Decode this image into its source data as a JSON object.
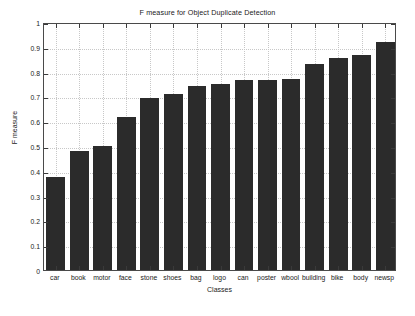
{
  "chart_data": {
    "type": "bar",
    "title": "F measure for Object Duplicate Detection",
    "xlabel": "Classes",
    "ylabel": "F measure",
    "categories": [
      "car",
      "book",
      "motor",
      "face",
      "stone",
      "shoes",
      "bag",
      "logo",
      "can",
      "poster",
      "wbool",
      "building",
      "bike",
      "body",
      "newsp"
    ],
    "values": [
      0.375,
      0.478,
      0.5,
      0.618,
      0.694,
      0.71,
      0.741,
      0.751,
      0.765,
      0.767,
      0.77,
      0.83,
      0.855,
      0.868,
      0.92
    ],
    "ylim": [
      0,
      1
    ],
    "yticks": [
      0,
      0.1,
      0.2,
      0.3,
      0.4,
      0.5,
      0.6,
      0.7,
      0.8,
      0.9,
      1
    ],
    "ytick_labels": [
      "0",
      "0.1",
      "0.2",
      "0.3",
      "0.4",
      "0.5",
      "0.6",
      "0.7",
      "0.8",
      "0.9",
      "1"
    ],
    "grid": true,
    "legend": null,
    "bar_color": "#2b2b2b",
    "axis_color": "#4a4a4a",
    "grid_color": "#c8c8c8",
    "background": "#ffffff"
  }
}
